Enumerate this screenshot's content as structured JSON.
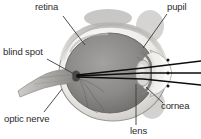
{
  "figure": {
    "type": "anatomical-diagram",
    "view": "sagittal-cross-section",
    "style": "grayscale-photographic",
    "background_color": "#ffffff",
    "labels": [
      {
        "id": "retina",
        "text": "retina",
        "side": "left",
        "x": 35,
        "y": 2
      },
      {
        "id": "blind-spot",
        "text": "blind spot",
        "side": "left",
        "x": 3,
        "y": 47
      },
      {
        "id": "optic-nerve",
        "text": "optic nerve",
        "side": "left",
        "x": 4,
        "y": 114
      },
      {
        "id": "pupil",
        "text": "pupil",
        "side": "right",
        "x": 167,
        "y": 2
      },
      {
        "id": "cornea",
        "text": "cornea",
        "side": "right",
        "x": 161,
        "y": 101
      },
      {
        "id": "lens",
        "text": "lens",
        "side": "right",
        "x": 130,
        "y": 126
      }
    ],
    "colors": {
      "label_text": "#2b2b2b",
      "leader_line": "#3a3a3a",
      "sclera_outer": "#f0efed",
      "sclera_rim": "#b9b7b4",
      "vitreous_body": "#8e8d8b",
      "vitreous_dark": "#6e6d6c",
      "cornea_highlight": "#f6f5f3",
      "lens_fill": "#d6d5d2",
      "optic_nerve": "#a9a7a4",
      "light_ray": "#101010"
    },
    "light_rays": {
      "count": 3,
      "direction": "right-to-left",
      "converge_at": "blind-spot",
      "entry": "cornea-pupil-lens"
    }
  }
}
